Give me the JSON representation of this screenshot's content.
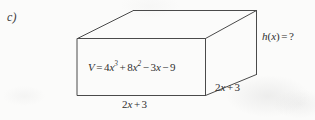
{
  "exercise": {
    "item_label": "c)"
  },
  "figure": {
    "type": "rectangular-prism",
    "projection": "oblique",
    "labels": {
      "volume": "V = 4x³ + 8x² − 3x − 9",
      "height": "h(x) = ?",
      "width": "2x + 3",
      "depth": "2x + 3"
    },
    "volume_parts": {
      "lhs": "V",
      "equals": "=",
      "t1_coef": "4",
      "t1_var": "x",
      "t1_exp": "3",
      "s1": "+",
      "t2_coef": "8",
      "t2_var": "x",
      "t2_exp": "2",
      "s2": "−",
      "t3_coef": "3",
      "t3_var": "x",
      "s3": "−",
      "t4_const": "9"
    },
    "height_parts": {
      "func": "h",
      "open": "(",
      "arg": "x",
      "close": ")",
      "equals": "=",
      "value": "?"
    },
    "edge_parts": {
      "coef": "2",
      "var": "x",
      "plus": "+",
      "const": "3"
    }
  },
  "style": {
    "line_color": "#4a4a4a",
    "background": "#fbfbfa",
    "text_color": "#2f2f2f"
  }
}
